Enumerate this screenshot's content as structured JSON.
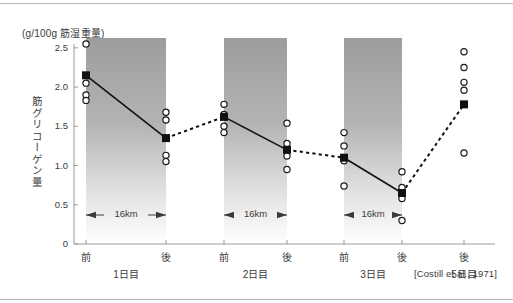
{
  "figure": {
    "unit_label": "(g/100g 筋湿重量)",
    "y_axis_title": "筋グリコーゲン量",
    "citation": "[Costill et al., 1971]"
  },
  "chart_data": {
    "type": "line",
    "title": "",
    "xlabel": "",
    "ylabel": "筋グリコーゲン量",
    "unit": "(g/100g 筋湿重量)",
    "ylim": [
      0,
      2.6
    ],
    "ytick_labels": [
      "0",
      "0.5",
      "1.0",
      "1.5",
      "2.0",
      "2.5"
    ],
    "ytick_values": [
      0,
      0.5,
      1.0,
      1.5,
      2.0,
      2.5
    ],
    "grid": false,
    "legend": "none",
    "categories": [
      "前",
      "後",
      "前",
      "後",
      "前",
      "後",
      "後"
    ],
    "group_labels": [
      "1日目",
      "2日目",
      "3日目",
      "5日目"
    ],
    "run_annotation": "16km",
    "run_annotation_count": 3,
    "series": [
      {
        "name": "平均値",
        "marker": "filled-square",
        "values": [
          2.15,
          1.35,
          1.62,
          1.2,
          1.1,
          0.65,
          1.78
        ],
        "segment_styles": [
          "solid",
          "dashed",
          "solid",
          "dashed",
          "solid",
          "dashed"
        ]
      }
    ],
    "individual_points": [
      {
        "category_index": 0,
        "values": [
          2.55,
          2.05,
          1.9,
          1.83
        ]
      },
      {
        "category_index": 1,
        "values": [
          1.68,
          1.58,
          1.13,
          1.05
        ]
      },
      {
        "category_index": 2,
        "values": [
          1.78,
          1.65,
          1.5,
          1.42
        ]
      },
      {
        "category_index": 3,
        "values": [
          1.54,
          1.28,
          1.12,
          0.95
        ]
      },
      {
        "category_index": 4,
        "values": [
          1.42,
          1.25,
          1.06,
          0.74
        ]
      },
      {
        "category_index": 5,
        "values": [
          0.92,
          0.72,
          0.58,
          0.3
        ]
      },
      {
        "category_index": 6,
        "values": [
          2.45,
          2.25,
          2.06,
          1.96,
          1.16
        ]
      }
    ],
    "shaded_bands": [
      {
        "between": [
          0,
          1
        ],
        "label": "16km",
        "style": "vertical-gradient-gray"
      },
      {
        "between": [
          2,
          3
        ],
        "label": "16km",
        "style": "vertical-gradient-gray"
      },
      {
        "between": [
          4,
          5
        ],
        "label": "16km",
        "style": "vertical-gradient-gray"
      }
    ],
    "colors": {
      "axis": "#9a9a9a",
      "marker": "#111111",
      "line": "#111111",
      "band_top": "#9d9d9d",
      "band_bottom": "#ffffff",
      "text": "#3b3b3b"
    }
  }
}
